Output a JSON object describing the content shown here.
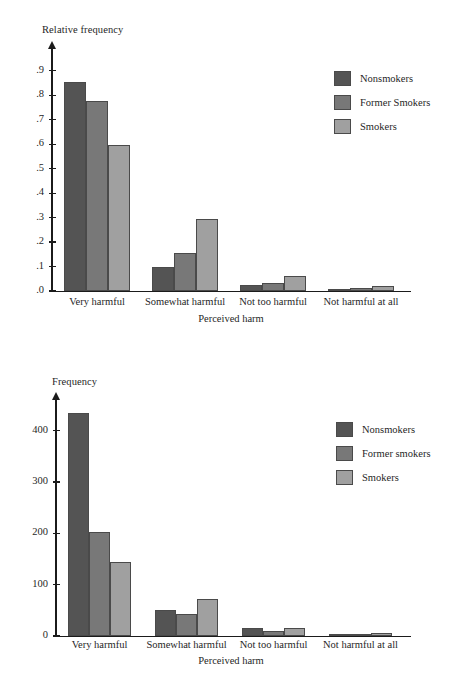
{
  "colors": {
    "series_nonsmokers": "#545454",
    "series_former": "#787878",
    "series_smokers": "#a0a0a0",
    "axis": "#1b1b1b",
    "bar_outline": "#4a4a4a",
    "background": "#ffffff"
  },
  "charts": [
    {
      "id": "relative-frequency",
      "chart_data": {
        "type": "bar",
        "title": "",
        "ylabel": "Relative frequency",
        "xlabel": "Perceived harm",
        "categories": [
          "Very harmful",
          "Somewhat harmful",
          "Not too harmful",
          "Not harmful at all"
        ],
        "series": [
          {
            "name": "Nonsmokers",
            "color": "#545454",
            "values": [
              0.855,
              0.1,
              0.025,
              0.008
            ]
          },
          {
            "name": "Former Smokers",
            "color": "#787878",
            "values": [
              0.775,
              0.155,
              0.033,
              0.012
            ]
          },
          {
            "name": "Smokers",
            "color": "#a0a0a0",
            "values": [
              0.595,
              0.295,
              0.063,
              0.021
            ]
          }
        ],
        "ylim": [
          0,
          0.95
        ],
        "yticks": [
          0,
          0.1,
          0.2,
          0.3,
          0.4,
          0.5,
          0.6,
          0.7,
          0.8,
          0.9
        ],
        "ytick_labels": [
          ".0",
          ".1",
          ".2",
          ".3",
          ".4",
          ".5",
          ".6",
          ".7",
          ".8",
          ".9"
        ],
        "grid": false,
        "legend_position": "top-right"
      }
    },
    {
      "id": "frequency",
      "chart_data": {
        "type": "bar",
        "title": "",
        "ylabel": "Frequency",
        "xlabel": "Perceived harm",
        "categories": [
          "Very harmful",
          "Somewhat harmful",
          "Not too harmful",
          "Not harmful at all"
        ],
        "series": [
          {
            "name": "Nonsmokers",
            "color": "#545454",
            "values": [
              434,
              50,
              16,
              4
            ]
          },
          {
            "name": "Former smokers",
            "color": "#787878",
            "values": [
              203,
              42,
              9,
              4
            ]
          },
          {
            "name": "Smokers",
            "color": "#a0a0a0",
            "values": [
              144,
              72,
              16,
              6
            ]
          }
        ],
        "ylim": [
          0,
          450
        ],
        "yticks": [
          0,
          100,
          200,
          300,
          400
        ],
        "ytick_labels": [
          "0",
          "100",
          "200",
          "300",
          "400"
        ],
        "grid": false,
        "legend_position": "top-right"
      }
    }
  ]
}
